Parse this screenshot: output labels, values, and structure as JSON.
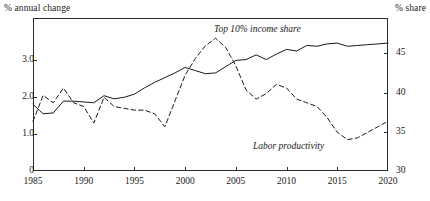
{
  "axes": {
    "left_title": "% annual change",
    "right_title": "% share",
    "left_ticks": [
      "0",
      "1.0",
      "2.0",
      "3.0"
    ],
    "right_ticks": [
      "30",
      "35",
      "40",
      "45"
    ],
    "x_ticks": [
      "1985",
      "1990",
      "1995",
      "2000",
      "2005",
      "2010",
      "2015",
      "2020"
    ]
  },
  "series_labels": {
    "top10": "Top 10% income share",
    "labor": "Labor productivity"
  },
  "colors": {
    "axis": "#2b2b2b",
    "top10_line": "#1a1a1a",
    "labor_line": "#1a1a1a"
  },
  "chart_data": {
    "type": "line",
    "title": "",
    "xlabel": "",
    "ylabel": "% annual change",
    "y2label": "% share",
    "xlim": [
      1985,
      2020
    ],
    "ylim": [
      0,
      4.15
    ],
    "y2lim": [
      30,
      49.5
    ],
    "grid": false,
    "legend": "inline-annotations",
    "x": [
      1985,
      1986,
      1987,
      1988,
      1989,
      1990,
      1991,
      1992,
      1993,
      1994,
      1995,
      1996,
      1997,
      1998,
      1999,
      2000,
      2001,
      2002,
      2003,
      2004,
      2005,
      2006,
      2007,
      2008,
      2009,
      2010,
      2011,
      2012,
      2013,
      2014,
      2015,
      2016,
      2017,
      2018,
      2019,
      2020
    ],
    "series": [
      {
        "name": "Top 10% income share",
        "axis": "right",
        "units": "% share",
        "style": "solid",
        "values": [
          38.5,
          37.3,
          37.4,
          38.9,
          38.9,
          38.8,
          38.7,
          39.6,
          39.2,
          39.4,
          39.8,
          40.6,
          41.3,
          41.9,
          42.5,
          43.2,
          42.8,
          42.4,
          42.5,
          43.3,
          44.1,
          44.2,
          44.8,
          44.2,
          44.9,
          45.5,
          45.3,
          46.0,
          45.9,
          46.2,
          46.3,
          45.9,
          46.0,
          46.1,
          46.2,
          46.3
        ]
      },
      {
        "name": "Labor productivity",
        "axis": "left",
        "units": "% annual change",
        "style": "dashed",
        "values": [
          1.35,
          2.05,
          1.85,
          2.25,
          1.85,
          1.75,
          1.3,
          2.0,
          1.75,
          1.7,
          1.65,
          1.65,
          1.55,
          1.2,
          1.9,
          2.6,
          3.05,
          3.4,
          3.6,
          3.35,
          2.85,
          2.2,
          1.95,
          2.1,
          2.35,
          2.25,
          1.95,
          1.85,
          1.75,
          1.45,
          1.05,
          0.85,
          0.9,
          1.05,
          1.2,
          1.35
        ]
      }
    ]
  }
}
